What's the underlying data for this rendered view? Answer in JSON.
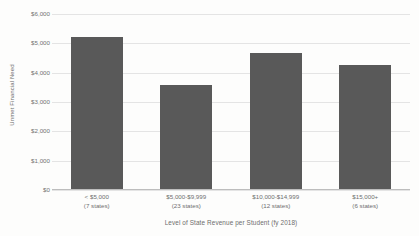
{
  "chart_data": {
    "type": "bar",
    "title": "",
    "subtitle": "",
    "xlabel": "Level of State Revenue per Student (fy 2018)",
    "ylabel": "Unmet Financial Need",
    "categories": [
      "< $5,000",
      "$5,000-$9,999",
      "$10,000-$14,999",
      "$15,000+"
    ],
    "category_sublabels": [
      "(7 states)",
      "(23 states)",
      "(12 states)",
      "(6 states)"
    ],
    "values": [
      5200,
      3580,
      4660,
      4270
    ],
    "ylim": [
      0,
      6000
    ],
    "ytick_values": [
      6000,
      5000,
      4000,
      3000,
      2000,
      1000,
      0
    ],
    "ytick_labels": [
      "$6,000",
      "$5,000",
      "$4,000",
      "$3,000",
      "$2,000",
      "$1,000",
      "$0"
    ],
    "grid": true,
    "legend": false,
    "legend_position": "none",
    "bar_color": "#595959",
    "gridline_color": "#e4e4e4",
    "axis_color": "#bdbdbd",
    "background_color": "#fdfdfc",
    "text_color": "#6d6d6d"
  }
}
